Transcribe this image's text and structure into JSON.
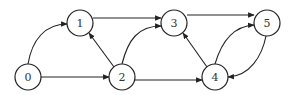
{
  "graph": {
    "type": "directed",
    "colors": {
      "stroke": "#222222",
      "fill": "#ffffff",
      "label": "#333333"
    },
    "node_radius": 13,
    "nodes": [
      {
        "id": "0",
        "label": "0",
        "x": 28,
        "y": 77
      },
      {
        "id": "1",
        "label": "1",
        "x": 80,
        "y": 23
      },
      {
        "id": "2",
        "label": "2",
        "x": 122,
        "y": 77
      },
      {
        "id": "3",
        "label": "3",
        "x": 174,
        "y": 23
      },
      {
        "id": "4",
        "label": "4",
        "x": 215,
        "y": 77
      },
      {
        "id": "5",
        "label": "5",
        "x": 267,
        "y": 23
      }
    ],
    "edges": [
      {
        "from": "0",
        "to": "1",
        "path": "M 28 64 C 32 40, 45 24, 67 24"
      },
      {
        "from": "0",
        "to": "2",
        "path": "M 41 77 L 109 77"
      },
      {
        "from": "2",
        "to": "1",
        "path": "M 114 67 L 89 33"
      },
      {
        "from": "1",
        "to": "3",
        "path": "M 93 18 L 161 18"
      },
      {
        "from": "2",
        "to": "3",
        "path": "M 122 64 C 128 40, 138 26, 161 26"
      },
      {
        "from": "2",
        "to": "4",
        "path": "M 135 80 L 202 80"
      },
      {
        "from": "3",
        "to": "5",
        "path": "M 187 15 L 254 15"
      },
      {
        "from": "4",
        "to": "3",
        "path": "M 207 67 L 183 33"
      },
      {
        "from": "4",
        "to": "5",
        "path": "M 215 64 C 222 40, 235 26, 254 25"
      },
      {
        "from": "5",
        "to": "4",
        "path": "M 266 36 C 262 56, 250 76, 228 77"
      }
    ]
  }
}
